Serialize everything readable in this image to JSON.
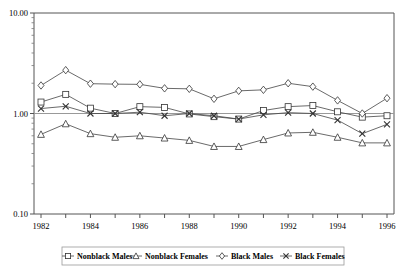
{
  "chart_data": {
    "type": "line",
    "title": "",
    "xlabel": "",
    "ylabel": "",
    "yscale": "log",
    "ylim": [
      0.1,
      10.0
    ],
    "ytick_labels": [
      "10.00",
      "1.00",
      "0.10"
    ],
    "ytick_values": [
      10.0,
      1.0,
      0.1
    ],
    "grid": "horizontal gridline at 1.00 only",
    "legend_position": "bottom",
    "x": [
      1982,
      1983,
      1984,
      1985,
      1986,
      1987,
      1988,
      1989,
      1990,
      1991,
      1992,
      1993,
      1994,
      1995,
      1996
    ],
    "xtick_labels": [
      "1982",
      "",
      "1984",
      "",
      "1986",
      "",
      "1988",
      "",
      "1990",
      "",
      "1992",
      "",
      "1994",
      "",
      "1996"
    ],
    "xlim": [
      1982,
      1996
    ],
    "series": [
      {
        "name": "Nonblack Males",
        "marker": "square",
        "values": [
          1.3,
          1.55,
          1.13,
          1.0,
          1.17,
          1.15,
          0.99,
          0.93,
          0.88,
          1.07,
          1.17,
          1.2,
          1.04,
          0.92,
          0.95
        ]
      },
      {
        "name": "Nonblack Females",
        "marker": "triangle",
        "values": [
          0.62,
          0.79,
          0.63,
          0.58,
          0.6,
          0.57,
          0.54,
          0.47,
          0.47,
          0.55,
          0.64,
          0.65,
          0.58,
          0.51,
          0.51
        ]
      },
      {
        "name": "Black Males",
        "marker": "diamond",
        "values": [
          1.9,
          2.7,
          1.98,
          1.96,
          1.95,
          1.78,
          1.76,
          1.4,
          1.68,
          1.72,
          2.0,
          1.85,
          1.35,
          1.0,
          1.42
        ]
      },
      {
        "name": "Black Females",
        "marker": "x",
        "values": [
          1.12,
          1.18,
          1.0,
          1.0,
          1.03,
          0.95,
          1.0,
          0.95,
          0.88,
          0.97,
          1.02,
          1.0,
          0.86,
          0.63,
          0.78
        ]
      }
    ]
  },
  "legend": {
    "items": [
      {
        "label": "Nonblack Males",
        "marker": "square"
      },
      {
        "label": "Nonblack Females",
        "marker": "triangle"
      },
      {
        "label": "Black Males",
        "marker": "diamond"
      },
      {
        "label": "Black Females",
        "marker": "x"
      }
    ]
  },
  "axes": {
    "y_top_label": "10.00",
    "y_mid_label": "1.00",
    "y_bottom_label": "0.10"
  }
}
